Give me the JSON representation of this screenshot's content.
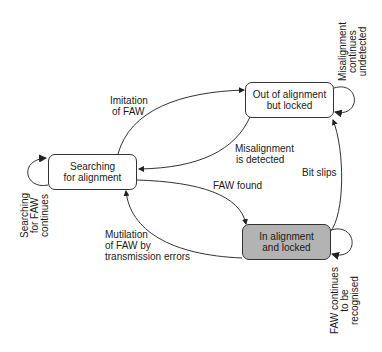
{
  "diagram": {
    "type": "state-transition",
    "states": [
      {
        "id": "searching",
        "lines": [
          "Searching",
          "for alignment"
        ],
        "shaded": false
      },
      {
        "id": "out_of_alignment",
        "lines": [
          "Out of alignment",
          "but locked"
        ],
        "shaded": false
      },
      {
        "id": "in_alignment",
        "lines": [
          "In alignment",
          "and locked"
        ],
        "shaded": true,
        "fill": "#b3b3b3"
      }
    ],
    "transitions": [
      {
        "from": "searching",
        "to": "out_of_alignment",
        "lines": [
          "Imitation",
          "of FAW"
        ]
      },
      {
        "from": "out_of_alignment",
        "to": "searching",
        "lines": [
          "Misalignment",
          "is detected"
        ]
      },
      {
        "from": "searching",
        "to": "in_alignment",
        "lines": [
          "FAW found"
        ]
      },
      {
        "from": "in_alignment",
        "to": "searching",
        "lines": [
          "Mutilation",
          "of FAW by",
          "transmission errors"
        ]
      },
      {
        "from": "in_alignment",
        "to": "out_of_alignment",
        "lines": [
          "Bit slips"
        ]
      }
    ],
    "self_loops": [
      {
        "state": "searching",
        "lines": [
          "Searching",
          "for FAW",
          "continues"
        ]
      },
      {
        "state": "out_of_alignment",
        "lines": [
          "Misalignment",
          "continues",
          "undetected"
        ]
      },
      {
        "state": "in_alignment",
        "lines": [
          "FAW continues",
          "to be",
          "recognised"
        ]
      }
    ]
  }
}
